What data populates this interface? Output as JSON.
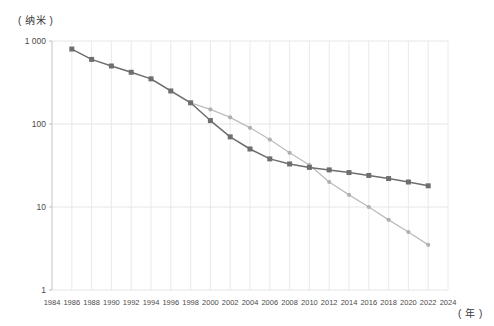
{
  "chart_data": {
    "type": "line",
    "title": "",
    "subtitle": "",
    "xlabel": "( 年 )",
    "ylabel": "( 纳米 )",
    "yscale": "log",
    "ylim": [
      1,
      1000
    ],
    "xlim": [
      1984,
      2024
    ],
    "grid": true,
    "legend_position": "none",
    "y_ticklabels": [
      "1 000",
      "100",
      "10",
      "1"
    ],
    "y_tickvalues": [
      1000,
      100,
      10,
      1
    ],
    "x_ticklabels": [
      "1984",
      "1986",
      "1988",
      "1990",
      "1992",
      "1994",
      "1996",
      "1998",
      "2000",
      "2002",
      "2004",
      "2006",
      "2008",
      "2010",
      "2012",
      "2014",
      "2016",
      "2018",
      "2020",
      "2022",
      "2024"
    ],
    "x_tickvalues": [
      1984,
      1986,
      1988,
      1990,
      1992,
      1994,
      1996,
      1998,
      2000,
      2002,
      2004,
      2006,
      2008,
      2010,
      2012,
      2014,
      2016,
      2018,
      2020,
      2022,
      2024
    ],
    "series": [
      {
        "name": "series-dark",
        "color": "#6e6e6e",
        "marker": "square",
        "x": [
          1986,
          1988,
          1990,
          1992,
          1994,
          1996,
          1998,
          2000,
          2002,
          2004,
          2006,
          2008,
          2010,
          2012,
          2014,
          2016,
          2018,
          2020,
          2022
        ],
        "values": [
          800,
          600,
          500,
          420,
          350,
          250,
          180,
          110,
          70,
          50,
          38,
          33,
          30,
          28,
          26,
          24,
          22,
          20,
          18
        ]
      },
      {
        "name": "series-light",
        "color": "#b0b0b0",
        "marker": "circle",
        "x": [
          1994,
          1996,
          1998,
          2000,
          2002,
          2004,
          2006,
          2008,
          2010,
          2012,
          2014,
          2016,
          2018,
          2020,
          2022
        ],
        "values": [
          350,
          250,
          180,
          150,
          120,
          90,
          65,
          45,
          32,
          20,
          14,
          10,
          7,
          5,
          3.5
        ]
      }
    ]
  }
}
